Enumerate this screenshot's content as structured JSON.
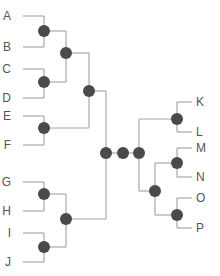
{
  "diagram": {
    "type": "dendrogram",
    "colors": {
      "edge": "#a8a8a8",
      "node": "#4a4a4a",
      "label": "#555555"
    },
    "leaves_left": [
      {
        "id": "A",
        "label": "A",
        "x": 13,
        "y": 16
      },
      {
        "id": "B",
        "label": "B",
        "x": 13,
        "y": 47
      },
      {
        "id": "C",
        "label": "C",
        "x": 13,
        "y": 69
      },
      {
        "id": "D",
        "label": "D",
        "x": 13,
        "y": 98
      },
      {
        "id": "E",
        "label": "E",
        "x": 13,
        "y": 116
      },
      {
        "id": "F",
        "label": "F",
        "x": 13,
        "y": 145
      },
      {
        "id": "G",
        "label": "G",
        "x": 13,
        "y": 182
      },
      {
        "id": "H",
        "label": "H",
        "x": 13,
        "y": 211
      },
      {
        "id": "I",
        "label": "I",
        "x": 13,
        "y": 233
      },
      {
        "id": "J",
        "label": "J",
        "x": 13,
        "y": 262
      }
    ],
    "leaves_right": [
      {
        "id": "K",
        "label": "K",
        "x": 202,
        "y": 102
      },
      {
        "id": "L",
        "label": "L",
        "x": 202,
        "y": 132
      },
      {
        "id": "M",
        "label": "M",
        "x": 202,
        "y": 148
      },
      {
        "id": "N",
        "label": "N",
        "x": 202,
        "y": 177
      },
      {
        "id": "O",
        "label": "O",
        "x": 202,
        "y": 198
      },
      {
        "id": "P",
        "label": "P",
        "x": 202,
        "y": 228
      }
    ],
    "internal_nodes": [
      {
        "id": "AB",
        "x": 44,
        "y": 31,
        "children": [
          "A",
          "B"
        ]
      },
      {
        "id": "CD",
        "x": 44,
        "y": 82,
        "children": [
          "C",
          "D"
        ]
      },
      {
        "id": "EF",
        "x": 44,
        "y": 128,
        "children": [
          "E",
          "F"
        ]
      },
      {
        "id": "ABCD",
        "x": 66,
        "y": 53,
        "children": [
          "AB",
          "CD"
        ]
      },
      {
        "id": "ABCDEF",
        "x": 89,
        "y": 91,
        "children": [
          "ABCD",
          "EF"
        ]
      },
      {
        "id": "GH",
        "x": 44,
        "y": 194,
        "children": [
          "G",
          "H"
        ]
      },
      {
        "id": "IJ",
        "x": 44,
        "y": 247,
        "children": [
          "I",
          "J"
        ]
      },
      {
        "id": "GHIJ",
        "x": 66,
        "y": 219,
        "children": [
          "GH",
          "IJ"
        ]
      },
      {
        "id": "LEFT",
        "x": 106,
        "y": 153,
        "children": [
          "ABCDEF",
          "GHIJ"
        ]
      },
      {
        "id": "ROOT",
        "x": 123,
        "y": 153,
        "children": [
          "LEFT",
          "RIGHT"
        ]
      },
      {
        "id": "RIGHT",
        "x": 139,
        "y": 153,
        "children": [
          "KL",
          "MNOP"
        ]
      },
      {
        "id": "KL",
        "x": 177,
        "y": 119,
        "children": [
          "K",
          "L"
        ]
      },
      {
        "id": "MN",
        "x": 177,
        "y": 163,
        "children": [
          "M",
          "N"
        ]
      },
      {
        "id": "OP",
        "x": 177,
        "y": 215,
        "children": [
          "O",
          "P"
        ]
      },
      {
        "id": "MNOP",
        "x": 155,
        "y": 191,
        "children": [
          "MN",
          "OP"
        ]
      }
    ]
  }
}
